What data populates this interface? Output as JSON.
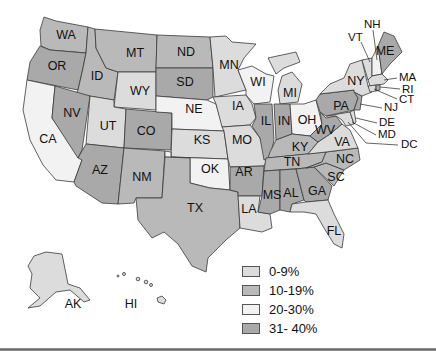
{
  "map": {
    "title": "",
    "colors": {
      "c0_9": "#dcdcdc",
      "c10_19": "#b9b9b9",
      "c20_30": "#f2f2f2",
      "c31_40": "#a9a9a9"
    },
    "states": {
      "WA": {
        "label": "WA",
        "bucket": "10-19%"
      },
      "OR": {
        "label": "OR",
        "bucket": "31-40%"
      },
      "ID": {
        "label": "ID",
        "bucket": "10-19%"
      },
      "MT": {
        "label": "MT",
        "bucket": "10-19%"
      },
      "WY": {
        "label": "WY",
        "bucket": "0-9%"
      },
      "CA": {
        "label": "CA",
        "bucket": "20-30%"
      },
      "NV": {
        "label": "NV",
        "bucket": "31-40%"
      },
      "UT": {
        "label": "UT",
        "bucket": "0-9%"
      },
      "CO": {
        "label": "CO",
        "bucket": "31-40%"
      },
      "AZ": {
        "label": "AZ",
        "bucket": "31-40%"
      },
      "NM": {
        "label": "NM",
        "bucket": "10-19%"
      },
      "ND": {
        "label": "ND",
        "bucket": "10-19%"
      },
      "SD": {
        "label": "SD",
        "bucket": "31-40%"
      },
      "NE": {
        "label": "NE",
        "bucket": "20-30%"
      },
      "KS": {
        "label": "KS",
        "bucket": "0-9%"
      },
      "OK": {
        "label": "OK",
        "bucket": "20-30%"
      },
      "TX": {
        "label": "TX",
        "bucket": "10-19%"
      },
      "MN": {
        "label": "MN",
        "bucket": "0-9%"
      },
      "IA": {
        "label": "IA",
        "bucket": "0-9%"
      },
      "MO": {
        "label": "MO",
        "bucket": "0-9%"
      },
      "AR": {
        "label": "AR",
        "bucket": "31-40%"
      },
      "LA": {
        "label": "LA",
        "bucket": "0-9%"
      },
      "WI": {
        "label": "WI",
        "bucket": "20-30%"
      },
      "IL": {
        "label": "IL",
        "bucket": "31-40%"
      },
      "MI": {
        "label": "MI",
        "bucket": "0-9%"
      },
      "IN": {
        "label": "IN",
        "bucket": "31-40%"
      },
      "OH": {
        "label": "OH",
        "bucket": "20-30%"
      },
      "KY": {
        "label": "KY",
        "bucket": "10-19%"
      },
      "TN": {
        "label": "TN",
        "bucket": "10-19%"
      },
      "MS": {
        "label": "MS",
        "bucket": "31-40%"
      },
      "AL": {
        "label": "AL",
        "bucket": "31-40%"
      },
      "GA": {
        "label": "GA",
        "bucket": "31-40%"
      },
      "FL": {
        "label": "FL",
        "bucket": "0-9%"
      },
      "SC": {
        "label": "SC",
        "bucket": "10-19%"
      },
      "NC": {
        "label": "NC",
        "bucket": "10-19%"
      },
      "VA": {
        "label": "VA",
        "bucket": "0-9%"
      },
      "WV": {
        "label": "WV",
        "bucket": "31-40%"
      },
      "PA": {
        "label": "PA",
        "bucket": "31-40%"
      },
      "NY": {
        "label": "NY",
        "bucket": "0-9%"
      },
      "VT": {
        "label": "VT",
        "bucket": "0-9%"
      },
      "NH": {
        "label": "NH",
        "bucket": "20-30%"
      },
      "ME": {
        "label": "ME",
        "bucket": "31-40%"
      },
      "MA": {
        "label": "MA",
        "bucket": "0-9%"
      },
      "RI": {
        "label": "RI",
        "bucket": "31-40%"
      },
      "CT": {
        "label": "CT",
        "bucket": "0-9%"
      },
      "NJ": {
        "label": "NJ",
        "bucket": "31-40%"
      },
      "DE": {
        "label": "DE",
        "bucket": "0-9%"
      },
      "MD": {
        "label": "MD",
        "bucket": "0-9%"
      },
      "DC": {
        "label": "DC",
        "bucket": "31-40%"
      },
      "AK": {
        "label": "AK",
        "bucket": "0-9%"
      },
      "HI": {
        "label": "HI",
        "bucket": "0-9%"
      }
    }
  },
  "legend": {
    "items": [
      {
        "label": "0-9%",
        "color": "#dcdcdc"
      },
      {
        "label": "10-19%",
        "color": "#b9b9b9"
      },
      {
        "label": "20-30%",
        "color": "#f2f2f2"
      },
      {
        "label": "31- 40%",
        "color": "#a9a9a9"
      }
    ]
  }
}
